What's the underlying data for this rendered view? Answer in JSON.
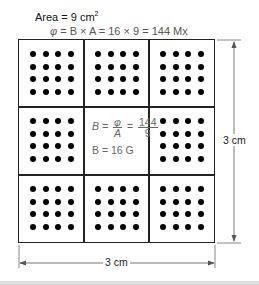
{
  "diagram": {
    "area_label": {
      "prefix": "Area = 9 cm",
      "superscript": "2"
    },
    "flux_label": {
      "phi": "φ",
      "text": " = B × A = 16 × 9 = 144 Mx"
    },
    "center_equation": {
      "lhs": "B =",
      "frac1_num": "φ",
      "frac1_den": "A",
      "eq": "=",
      "frac2_num": "144",
      "frac2_den": "9"
    },
    "center_result": "B = 16 G",
    "dimension_right": "3 cm",
    "dimension_bottom": "3 cm",
    "grid": {
      "rows": 3,
      "cols": 3,
      "dots_per_cell": 16,
      "center_cell_empty": true
    },
    "colors": {
      "line": "#222222",
      "dot": "#000000",
      "equation_text": "#666666",
      "strip": "#dedede"
    }
  }
}
